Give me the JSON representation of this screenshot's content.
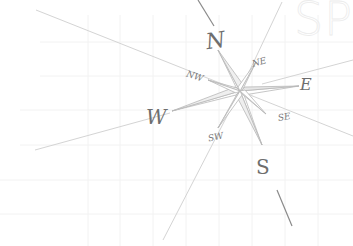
{
  "watermark": {
    "text": "SP"
  },
  "compass": {
    "center": [
      240,
      91
    ],
    "labels": {
      "N": "N",
      "NE": "NE",
      "E": "E",
      "SE": "SE",
      "S": "S",
      "SW": "SW",
      "W": "W",
      "NW": "NW"
    }
  },
  "colors": {
    "line": "#cfcfcf",
    "grid": "#f1f1f1",
    "label": "#6e6e6e",
    "fill": "#e9e9e9"
  }
}
